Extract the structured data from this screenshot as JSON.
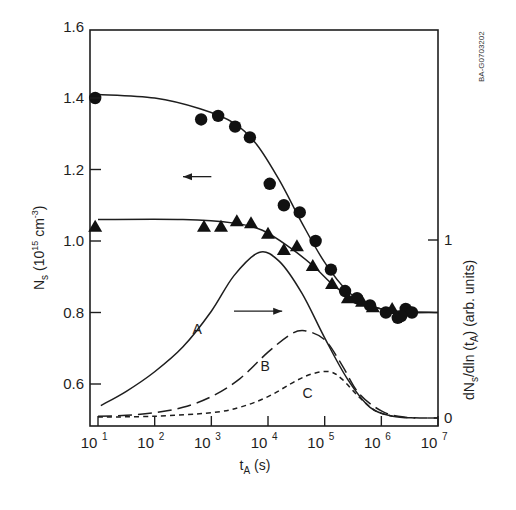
{
  "chart_data": {
    "type": "scatter",
    "title": "",
    "xlabel": "t_A (s)",
    "xlabel_main": "t",
    "xlabel_sub": "A",
    "xlabel_unit": " (s)",
    "ylabel": "N_s (10^15 cm^-3)",
    "ylabel_parts": {
      "main": "N",
      "sub": "s",
      "pre_exp": " (10",
      "exp": "15",
      "mid": " cm",
      "exp2": "-3",
      "post": ")"
    },
    "y2label": "dN_s/dln (t_A) (arb. units)",
    "y2label_parts": {
      "a": "dN",
      "sub1": "s",
      "b": "/dln (t",
      "sub2": "A",
      "c": ") (arb. units)"
    },
    "xscale": "log",
    "xlim_log10": [
      0.9,
      7
    ],
    "ylim": [
      0.485,
      1.6
    ],
    "y2lim": [
      0,
      1
    ],
    "x_ticks": [
      {
        "base": "10",
        "exp": "1",
        "log": 1
      },
      {
        "base": "10",
        "exp": "2",
        "log": 2
      },
      {
        "base": "10",
        "exp": "3",
        "log": 3
      },
      {
        "base": "10",
        "exp": "4",
        "log": 4
      },
      {
        "base": "10",
        "exp": "5",
        "log": 5
      },
      {
        "base": "10",
        "exp": "6",
        "log": 6
      },
      {
        "base": "10",
        "exp": "7",
        "log": 7
      }
    ],
    "y_ticks": [
      "0.6",
      "0.8",
      "1.0",
      "1.2",
      "1.4",
      "1.6"
    ],
    "y2_ticks": [
      "0",
      "1"
    ],
    "watermark": "BA-G0703202",
    "series": [
      {
        "name": "circles",
        "axis": "left",
        "marker": "circle",
        "points": [
          [
            0.95,
            1.4
          ],
          [
            2.82,
            1.34
          ],
          [
            3.12,
            1.35
          ],
          [
            3.42,
            1.32
          ],
          [
            3.68,
            1.29
          ],
          [
            4.03,
            1.16
          ],
          [
            4.28,
            1.1
          ],
          [
            4.56,
            1.08
          ],
          [
            4.84,
            1.0
          ],
          [
            5.11,
            0.92
          ],
          [
            5.36,
            0.86
          ],
          [
            5.57,
            0.84
          ],
          [
            5.8,
            0.82
          ],
          [
            6.08,
            0.8
          ],
          [
            6.29,
            0.785
          ],
          [
            6.43,
            0.81
          ],
          [
            6.54,
            0.8
          ],
          [
            6.35,
            0.79
          ]
        ]
      },
      {
        "name": "triangles",
        "axis": "left",
        "marker": "triangle",
        "points": [
          [
            0.95,
            1.04
          ],
          [
            2.87,
            1.04
          ],
          [
            3.17,
            1.04
          ],
          [
            3.45,
            1.055
          ],
          [
            3.7,
            1.05
          ],
          [
            4.0,
            1.02
          ],
          [
            4.28,
            0.975
          ],
          [
            4.51,
            0.985
          ],
          [
            4.79,
            0.93
          ],
          [
            5.13,
            0.88
          ],
          [
            5.41,
            0.84
          ],
          [
            5.66,
            0.83
          ],
          [
            5.85,
            0.815
          ],
          [
            6.19,
            0.81
          ]
        ]
      },
      {
        "name": "circle fit",
        "axis": "left",
        "style": "solid",
        "points": [
          [
            1.0,
            1.41
          ],
          [
            2.0,
            1.4
          ],
          [
            2.8,
            1.37
          ],
          [
            3.4,
            1.33
          ],
          [
            3.8,
            1.27
          ],
          [
            4.2,
            1.17
          ],
          [
            4.6,
            1.05
          ],
          [
            5.0,
            0.94
          ],
          [
            5.4,
            0.86
          ],
          [
            5.8,
            0.82
          ],
          [
            6.2,
            0.805
          ],
          [
            7.0,
            0.8
          ]
        ]
      },
      {
        "name": "triangle fit",
        "axis": "left",
        "style": "solid",
        "points": [
          [
            1.0,
            1.06
          ],
          [
            2.5,
            1.06
          ],
          [
            3.4,
            1.05
          ],
          [
            3.9,
            1.03
          ],
          [
            4.4,
            0.98
          ],
          [
            4.8,
            0.93
          ],
          [
            5.2,
            0.87
          ],
          [
            5.6,
            0.83
          ],
          [
            6.0,
            0.81
          ],
          [
            6.4,
            0.8
          ],
          [
            7.0,
            0.8
          ]
        ]
      },
      {
        "name": "A",
        "axis": "right",
        "style": "solid",
        "points": [
          [
            1.05,
            0.07
          ],
          [
            1.5,
            0.15
          ],
          [
            2.0,
            0.26
          ],
          [
            2.5,
            0.4
          ],
          [
            3.0,
            0.6
          ],
          [
            3.4,
            0.8
          ],
          [
            3.84,
            0.93
          ],
          [
            4.2,
            0.88
          ],
          [
            4.6,
            0.7
          ],
          [
            5.0,
            0.45
          ],
          [
            5.4,
            0.22
          ],
          [
            5.8,
            0.06
          ],
          [
            6.2,
            0.01
          ],
          [
            6.6,
            0.0
          ]
        ]
      },
      {
        "name": "B",
        "axis": "right",
        "style": "dashed",
        "points": [
          [
            1.0,
            0.01
          ],
          [
            1.5,
            0.015
          ],
          [
            2.0,
            0.03
          ],
          [
            2.5,
            0.06
          ],
          [
            3.0,
            0.12
          ],
          [
            3.5,
            0.22
          ],
          [
            4.0,
            0.37
          ],
          [
            4.4,
            0.47
          ],
          [
            4.65,
            0.49
          ],
          [
            5.0,
            0.44
          ],
          [
            5.3,
            0.3
          ],
          [
            5.6,
            0.14
          ],
          [
            6.0,
            0.04
          ],
          [
            6.4,
            0.005
          ],
          [
            7.0,
            0.0
          ]
        ]
      },
      {
        "name": "C",
        "axis": "right",
        "style": "dotted",
        "points": [
          [
            1.0,
            0.005
          ],
          [
            2.0,
            0.01
          ],
          [
            3.0,
            0.03
          ],
          [
            3.5,
            0.06
          ],
          [
            4.0,
            0.12
          ],
          [
            4.5,
            0.21
          ],
          [
            4.8,
            0.25
          ],
          [
            5.09,
            0.26
          ],
          [
            5.3,
            0.22
          ],
          [
            5.6,
            0.12
          ],
          [
            5.9,
            0.04
          ],
          [
            6.2,
            0.01
          ]
        ]
      }
    ],
    "annotations": [
      {
        "text": "A",
        "log": 2.75,
        "y2": 0.5
      },
      {
        "text": "B",
        "log": 3.95,
        "y2": 0.29
      },
      {
        "text": "C",
        "log": 4.7,
        "y2": 0.14
      },
      {
        "type": "arrow-left",
        "from_log": 3.0,
        "to_log": 2.5,
        "y": 1.18
      },
      {
        "type": "arrow-right",
        "from_log": 3.4,
        "to_log": 4.25,
        "y2": 0.6
      }
    ]
  }
}
